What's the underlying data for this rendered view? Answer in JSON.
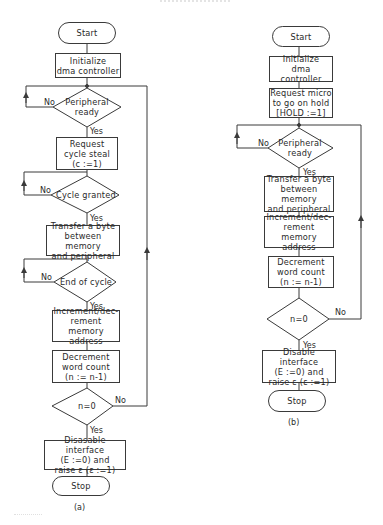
{
  "figure": {
    "header_text": "",
    "charts": [
      {
        "id": "a",
        "caption": "(a)",
        "nodes": {
          "start": "Start",
          "init": "Initialize\ndma controller",
          "peripheral_ready": "Peripheral\nready",
          "request_cycle_steal": "Request\ncycle steal\n(c :=1)",
          "cycle_granted": "Cycle granted",
          "transfer": "Transfer a byte\nbetween memory\nand peripheral",
          "end_of_cycle": "End of cycle",
          "increment": "Increment/dec-\nrement memory\naddress",
          "decrement": "Decrement\nword count\n(n := n-1)",
          "n_zero": "n=0",
          "disable": "Disasable interface\n(E :=0) and\nraise ε (ε :=1)",
          "stop": "Stop"
        },
        "labels": {
          "peripheral_no": "No",
          "peripheral_yes": "Yes",
          "cycle_no": "No",
          "cycle_yes": "Yes",
          "end_no": "No",
          "end_yes": "Yes",
          "n_no": "No",
          "n_yes": "Yes"
        }
      },
      {
        "id": "b",
        "caption": "(b)",
        "nodes": {
          "start": "Start",
          "init": "Initialize\ndma controller",
          "request_hold": "Request micro\nto go on hold\n[HOLD :=1]",
          "peripheral_ready": "Peripheral\nready",
          "transfer": "Transfer a byte\nbetween memory\nand peripheral",
          "increment": "Increment/dec-\nrement memory\naddress",
          "decrement": "Decrement\nword count\n(n := n-1)",
          "n_zero": "n=0",
          "disable": "Disable interface\n(E :=0) and\nraise ε (ε :=1)",
          "stop": "Stop"
        },
        "labels": {
          "peripheral_no": "No",
          "peripheral_yes": "Yes",
          "n_no": "No",
          "n_yes": "Yes"
        }
      }
    ]
  },
  "colors": {
    "line": "#3a3a3a",
    "background": "#ffffff",
    "text": "#2a2a2a"
  }
}
